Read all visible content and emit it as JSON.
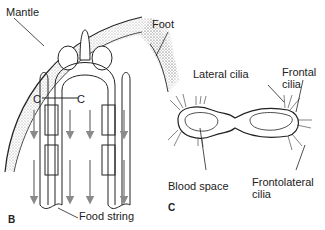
{
  "figure": {
    "panels": [
      {
        "id": "B",
        "label": "B",
        "description": "Gill filaments in longitudinal view with mantle, foot and food string"
      },
      {
        "id": "C",
        "label": "C",
        "description": "Cross section C–C of two gill filaments"
      }
    ],
    "labels": {
      "mantle": "Mantle",
      "foot": "Foot",
      "section_left": "C",
      "section_right": "C",
      "food_string": "Food string",
      "lateral_cilia": "Lateral cilia",
      "frontal_cilia_line1": "Frontal",
      "frontal_cilia_line2": "cilia",
      "blood_space": "Blood space",
      "frontolateral_line1": "Frontolateral",
      "frontolateral_line2": "cilia",
      "panel_b": "B",
      "panel_c": "C"
    },
    "colors": {
      "ink": "#222222",
      "arrow": "#8a8a8a",
      "stipple": "#9a9a9a",
      "background": "#ffffff"
    }
  }
}
